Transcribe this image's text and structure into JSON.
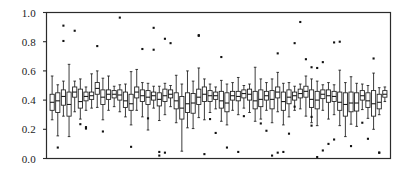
{
  "chart_data": {
    "type": "box",
    "title": "",
    "xlabel": "",
    "ylabel": "",
    "ylim": [
      0.0,
      1.0
    ],
    "xlim": [
      0,
      61
    ],
    "grid": false,
    "legend": null,
    "annotations": [],
    "ytick_labels": [
      "1.0",
      "0.8",
      "0.6",
      "0.4",
      "0.2",
      "0.0"
    ],
    "ytick_values": [
      1.0,
      0.8,
      0.6,
      0.4,
      0.2,
      0.0
    ],
    "xtick_labels": [],
    "box_color": "#1a1a1a",
    "box_fill": "#ffffff",
    "outlier_color": "#111111",
    "frame_color": "#2b2b2b",
    "n_boxes": 60,
    "boxes": [
      {
        "x": 1,
        "whisker_low": 0.265,
        "q1": 0.33,
        "median": 0.385,
        "q3": 0.44,
        "whisker_high": 0.565,
        "outliers": []
      },
      {
        "x": 2,
        "whisker_low": 0.155,
        "q1": 0.315,
        "median": 0.395,
        "q3": 0.45,
        "whisker_high": 0.505,
        "outliers": [
          0.075
        ]
      },
      {
        "x": 3,
        "whisker_low": 0.29,
        "q1": 0.365,
        "median": 0.425,
        "q3": 0.47,
        "whisker_high": 0.53,
        "outliers": [
          0.91,
          0.805
        ]
      },
      {
        "x": 4,
        "whisker_low": 0.15,
        "q1": 0.29,
        "median": 0.37,
        "q3": 0.455,
        "whisker_high": 0.645,
        "outliers": []
      },
      {
        "x": 5,
        "whisker_low": 0.32,
        "q1": 0.42,
        "median": 0.455,
        "q3": 0.49,
        "whisker_high": 0.53,
        "outliers": [
          0.875
        ]
      },
      {
        "x": 6,
        "whisker_low": 0.27,
        "q1": 0.345,
        "median": 0.39,
        "q3": 0.475,
        "whisker_high": 0.545,
        "outliers": [
          0.235
        ]
      },
      {
        "x": 7,
        "whisker_low": 0.33,
        "q1": 0.395,
        "median": 0.425,
        "q3": 0.455,
        "whisker_high": 0.49,
        "outliers": [
          0.205,
          0.215
        ]
      },
      {
        "x": 8,
        "whisker_low": 0.345,
        "q1": 0.405,
        "median": 0.43,
        "q3": 0.455,
        "whisker_high": 0.58,
        "outliers": []
      },
      {
        "x": 9,
        "whisker_low": 0.35,
        "q1": 0.44,
        "median": 0.48,
        "q3": 0.52,
        "whisker_high": 0.6,
        "outliers": [
          0.77
        ]
      },
      {
        "x": 10,
        "whisker_low": 0.265,
        "q1": 0.37,
        "median": 0.42,
        "q3": 0.47,
        "whisker_high": 0.55,
        "outliers": [
          0.185
        ]
      },
      {
        "x": 11,
        "whisker_low": 0.33,
        "q1": 0.405,
        "median": 0.44,
        "q3": 0.47,
        "whisker_high": 0.565,
        "outliers": []
      },
      {
        "x": 12,
        "whisker_low": 0.355,
        "q1": 0.415,
        "median": 0.44,
        "q3": 0.465,
        "whisker_high": 0.495,
        "outliers": []
      },
      {
        "x": 13,
        "whisker_low": 0.32,
        "q1": 0.4,
        "median": 0.435,
        "q3": 0.47,
        "whisker_high": 0.505,
        "outliers": [
          0.965
        ]
      },
      {
        "x": 14,
        "whisker_low": 0.285,
        "q1": 0.35,
        "median": 0.395,
        "q3": 0.455,
        "whisker_high": 0.51,
        "outliers": []
      },
      {
        "x": 15,
        "whisker_low": 0.23,
        "q1": 0.33,
        "median": 0.375,
        "q3": 0.44,
        "whisker_high": 0.595,
        "outliers": [
          0.08
        ]
      },
      {
        "x": 16,
        "whisker_low": 0.33,
        "q1": 0.415,
        "median": 0.455,
        "q3": 0.49,
        "whisker_high": 0.61,
        "outliers": []
      },
      {
        "x": 17,
        "whisker_low": 0.285,
        "q1": 0.39,
        "median": 0.43,
        "q3": 0.47,
        "whisker_high": 0.52,
        "outliers": [
          0.75
        ]
      },
      {
        "x": 18,
        "whisker_low": 0.195,
        "q1": 0.37,
        "median": 0.42,
        "q3": 0.465,
        "whisker_high": 0.515,
        "outliers": [
          0.275
        ]
      },
      {
        "x": 19,
        "whisker_low": 0.345,
        "q1": 0.4,
        "median": 0.43,
        "q3": 0.455,
        "whisker_high": 0.495,
        "outliers": [
          0.895,
          0.745
        ]
      },
      {
        "x": 20,
        "whisker_low": 0.26,
        "q1": 0.36,
        "median": 0.405,
        "q3": 0.45,
        "whisker_high": 0.495,
        "outliers": [
          0.02,
          0.045
        ]
      },
      {
        "x": 21,
        "whisker_low": 0.3,
        "q1": 0.39,
        "median": 0.43,
        "q3": 0.475,
        "whisker_high": 0.515,
        "outliers": [
          0.82,
          0.04
        ]
      },
      {
        "x": 22,
        "whisker_low": 0.355,
        "q1": 0.415,
        "median": 0.44,
        "q3": 0.47,
        "whisker_high": 0.5,
        "outliers": [
          0.79
        ]
      },
      {
        "x": 23,
        "whisker_low": 0.245,
        "q1": 0.34,
        "median": 0.395,
        "q3": 0.45,
        "whisker_high": 0.57,
        "outliers": []
      },
      {
        "x": 24,
        "whisker_low": 0.05,
        "q1": 0.27,
        "median": 0.345,
        "q3": 0.425,
        "whisker_high": 0.51,
        "outliers": []
      },
      {
        "x": 25,
        "whisker_low": 0.21,
        "q1": 0.315,
        "median": 0.375,
        "q3": 0.45,
        "whisker_high": 0.6,
        "outliers": []
      },
      {
        "x": 26,
        "whisker_low": 0.205,
        "q1": 0.31,
        "median": 0.38,
        "q3": 0.445,
        "whisker_high": 0.53,
        "outliers": []
      },
      {
        "x": 27,
        "whisker_low": 0.28,
        "q1": 0.37,
        "median": 0.42,
        "q3": 0.475,
        "whisker_high": 0.62,
        "outliers": [
          0.845,
          0.84
        ]
      },
      {
        "x": 28,
        "whisker_low": 0.265,
        "q1": 0.39,
        "median": 0.44,
        "q3": 0.49,
        "whisker_high": 0.545,
        "outliers": [
          0.03
        ]
      },
      {
        "x": 29,
        "whisker_low": 0.315,
        "q1": 0.39,
        "median": 0.43,
        "q3": 0.465,
        "whisker_high": 0.51,
        "outliers": [
          0.27
        ]
      },
      {
        "x": 30,
        "whisker_low": 0.34,
        "q1": 0.405,
        "median": 0.43,
        "q3": 0.455,
        "whisker_high": 0.49,
        "outliers": [
          0.175
        ]
      },
      {
        "x": 31,
        "whisker_low": 0.255,
        "q1": 0.345,
        "median": 0.395,
        "q3": 0.46,
        "whisker_high": 0.535,
        "outliers": [
          0.695
        ]
      },
      {
        "x": 32,
        "whisker_low": 0.23,
        "q1": 0.32,
        "median": 0.38,
        "q3": 0.45,
        "whisker_high": 0.51,
        "outliers": [
          0.075
        ]
      },
      {
        "x": 33,
        "whisker_low": 0.33,
        "q1": 0.4,
        "median": 0.43,
        "q3": 0.46,
        "whisker_high": 0.52,
        "outliers": []
      },
      {
        "x": 34,
        "whisker_low": 0.3,
        "q1": 0.395,
        "median": 0.425,
        "q3": 0.46,
        "whisker_high": 0.555,
        "outliers": [
          0.045
        ]
      },
      {
        "x": 35,
        "whisker_low": 0.345,
        "q1": 0.415,
        "median": 0.445,
        "q3": 0.47,
        "whisker_high": 0.5,
        "outliers": [
          0.29
        ]
      },
      {
        "x": 36,
        "whisker_low": 0.315,
        "q1": 0.4,
        "median": 0.44,
        "q3": 0.475,
        "whisker_high": 0.51,
        "outliers": []
      },
      {
        "x": 37,
        "whisker_low": 0.255,
        "q1": 0.34,
        "median": 0.395,
        "q3": 0.46,
        "whisker_high": 0.625,
        "outliers": []
      },
      {
        "x": 38,
        "whisker_low": 0.27,
        "q1": 0.355,
        "median": 0.405,
        "q3": 0.47,
        "whisker_high": 0.545,
        "outliers": [
          0.24
        ]
      },
      {
        "x": 39,
        "whisker_low": 0.33,
        "q1": 0.4,
        "median": 0.43,
        "q3": 0.46,
        "whisker_high": 0.52,
        "outliers": [
          0.19
        ]
      },
      {
        "x": 40,
        "whisker_low": 0.245,
        "q1": 0.34,
        "median": 0.405,
        "q3": 0.465,
        "whisker_high": 0.545,
        "outliers": [
          0.02
        ]
      },
      {
        "x": 41,
        "whisker_low": 0.32,
        "q1": 0.415,
        "median": 0.455,
        "q3": 0.49,
        "whisker_high": 0.59,
        "outliers": [
          0.72,
          0.04
        ]
      },
      {
        "x": 42,
        "whisker_low": 0.23,
        "q1": 0.33,
        "median": 0.39,
        "q3": 0.455,
        "whisker_high": 0.515,
        "outliers": [
          0.045
        ]
      },
      {
        "x": 43,
        "whisker_low": 0.285,
        "q1": 0.375,
        "median": 0.42,
        "q3": 0.47,
        "whisker_high": 0.52,
        "outliers": [
          0.17
        ]
      },
      {
        "x": 44,
        "whisker_low": 0.33,
        "q1": 0.4,
        "median": 0.43,
        "q3": 0.455,
        "whisker_high": 0.495,
        "outliers": [
          0.355,
          0.79
        ]
      },
      {
        "x": 45,
        "whisker_low": 0.34,
        "q1": 0.415,
        "median": 0.445,
        "q3": 0.475,
        "whisker_high": 0.51,
        "outliers": [
          0.935
        ]
      },
      {
        "x": 46,
        "whisker_low": 0.29,
        "q1": 0.42,
        "median": 0.46,
        "q3": 0.495,
        "whisker_high": 0.565,
        "outliers": [
          0.68
        ]
      },
      {
        "x": 47,
        "whisker_low": 0.245,
        "q1": 0.35,
        "median": 0.405,
        "q3": 0.47,
        "whisker_high": 0.545,
        "outliers": [
          0.625,
          0.285,
          0.225
        ]
      },
      {
        "x": 48,
        "whisker_low": 0.225,
        "q1": 0.34,
        "median": 0.4,
        "q3": 0.46,
        "whisker_high": 0.53,
        "outliers": [
          0.62,
          0.01
        ]
      },
      {
        "x": 49,
        "whisker_low": 0.33,
        "q1": 0.41,
        "median": 0.44,
        "q3": 0.47,
        "whisker_high": 0.505,
        "outliers": [
          0.66,
          0.055
        ]
      },
      {
        "x": 50,
        "whisker_low": 0.27,
        "q1": 0.385,
        "median": 0.43,
        "q3": 0.47,
        "whisker_high": 0.52,
        "outliers": [
          0.1
        ]
      },
      {
        "x": 51,
        "whisker_low": 0.3,
        "q1": 0.39,
        "median": 0.425,
        "q3": 0.46,
        "whisker_high": 0.505,
        "outliers": [
          0.795,
          0.13
        ]
      },
      {
        "x": 52,
        "whisker_low": 0.225,
        "q1": 0.33,
        "median": 0.385,
        "q3": 0.455,
        "whisker_high": 0.605,
        "outliers": [
          0.8
        ]
      },
      {
        "x": 53,
        "whisker_low": 0.15,
        "q1": 0.29,
        "median": 0.37,
        "q3": 0.45,
        "whisker_high": 0.52,
        "outliers": []
      },
      {
        "x": 54,
        "whisker_low": 0.235,
        "q1": 0.32,
        "median": 0.38,
        "q3": 0.455,
        "whisker_high": 0.56,
        "outliers": [
          0.085
        ]
      },
      {
        "x": 55,
        "whisker_low": 0.22,
        "q1": 0.325,
        "median": 0.38,
        "q3": 0.45,
        "whisker_high": 0.515,
        "outliers": []
      },
      {
        "x": 56,
        "whisker_low": 0.335,
        "q1": 0.4,
        "median": 0.43,
        "q3": 0.465,
        "whisker_high": 0.51,
        "outliers": [
          0.245
        ]
      },
      {
        "x": 57,
        "whisker_low": 0.275,
        "q1": 0.35,
        "median": 0.395,
        "q3": 0.45,
        "whisker_high": 0.5,
        "outliers": [
          0.135
        ]
      },
      {
        "x": 58,
        "whisker_low": 0.2,
        "q1": 0.29,
        "median": 0.375,
        "q3": 0.465,
        "whisker_high": 0.585,
        "outliers": [
          0.685
        ]
      },
      {
        "x": 59,
        "whisker_low": 0.3,
        "q1": 0.34,
        "median": 0.385,
        "q3": 0.44,
        "whisker_high": 0.485,
        "outliers": [
          0.04,
          0.04
        ]
      },
      {
        "x": 60,
        "whisker_low": 0.39,
        "q1": 0.42,
        "median": 0.44,
        "q3": 0.465,
        "whisker_high": 0.49,
        "outliers": []
      }
    ]
  }
}
